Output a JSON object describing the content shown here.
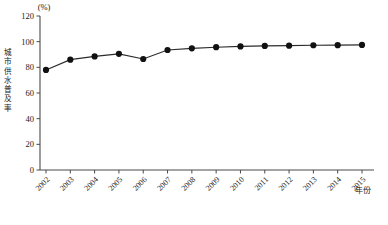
{
  "chart_data": {
    "type": "line",
    "title": "",
    "unit_label": "(%)",
    "xlabel": "年份",
    "ylabel": "城市供水普及率",
    "ylabel_chars": [
      "城",
      "市",
      "供",
      "水",
      "普",
      "及",
      "率"
    ],
    "categories": [
      "2002",
      "2003",
      "2004",
      "2005",
      "2006",
      "2007",
      "2008",
      "2009",
      "2010",
      "2011",
      "2012",
      "2013",
      "2014",
      "2015"
    ],
    "values": [
      78.0,
      86.0,
      88.5,
      90.5,
      86.5,
      93.5,
      94.8,
      95.7,
      96.3,
      96.7,
      96.9,
      97.2,
      97.3,
      97.5
    ],
    "ylim": [
      0,
      120
    ],
    "yticks": [
      0,
      20,
      40,
      60,
      80,
      100,
      120
    ],
    "ytick_labels": [
      "0",
      "20",
      "40",
      "60",
      "80",
      "100",
      "120"
    ],
    "grid": false,
    "legend": "none",
    "marker": "filled-circle",
    "line_color": "#2b2b2b",
    "marker_color": "#111111",
    "axis_color": "#4a4a4a"
  },
  "caption": ""
}
